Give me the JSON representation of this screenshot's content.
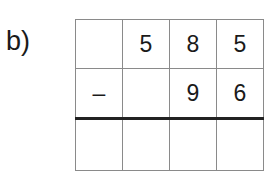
{
  "exercise": {
    "label": "b)",
    "operation": "subtraction",
    "rows": [
      [
        "",
        "5",
        "8",
        "5"
      ],
      [
        "–",
        "",
        "9",
        "6"
      ],
      [
        "",
        "",
        "",
        ""
      ]
    ]
  }
}
